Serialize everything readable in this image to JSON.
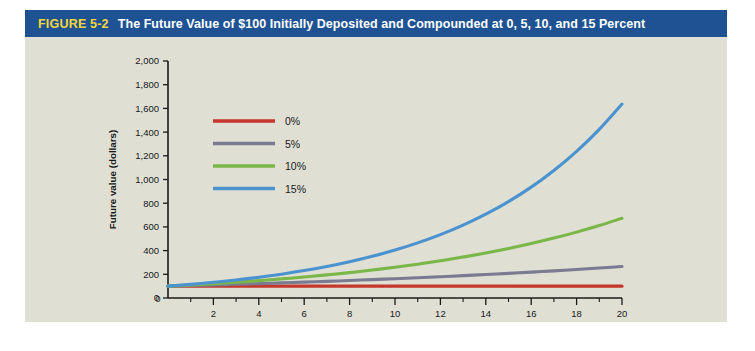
{
  "figure": {
    "number_label": "FIGURE 5-2",
    "title": "The Future Value of $100 Initially Deposited and Compounded at 0, 5, 10, and 15 Percent",
    "header_bg": "#1e5293",
    "number_color": "#f5d73a",
    "title_color": "#ffffff",
    "panel_bg": "#dfdfd4"
  },
  "chart_data": {
    "type": "line",
    "title": "The Future Value of $100 Initially Deposited and Compounded at 0, 5, 10, and 15 Percent",
    "xlabel": "Number of years",
    "ylabel": "Future value (dollars)",
    "xlim": [
      0,
      20
    ],
    "ylim": [
      0,
      2000
    ],
    "grid": false,
    "legend_position": "upper-left-inside",
    "x_ticks_major": [
      0,
      2,
      4,
      6,
      8,
      10,
      12,
      14,
      16,
      18,
      20
    ],
    "x_tick_labels": [
      "0",
      "2",
      "4",
      "6",
      "8",
      "10",
      "12",
      "14",
      "16",
      "18",
      "20"
    ],
    "x_ticks_minor": [
      1,
      3,
      5,
      7,
      9,
      11,
      13,
      15,
      17,
      19
    ],
    "y_ticks": [
      0,
      200,
      400,
      600,
      800,
      1000,
      1200,
      1400,
      1600,
      1800,
      2000
    ],
    "y_tick_labels": [
      "0",
      "200",
      "400",
      "600",
      "800",
      "1,000",
      "1,200",
      "1,400",
      "1,600",
      "1,800",
      "2,000"
    ],
    "x": [
      0,
      1,
      2,
      3,
      4,
      5,
      6,
      7,
      8,
      9,
      10,
      11,
      12,
      13,
      14,
      15,
      16,
      17,
      18,
      19,
      20
    ],
    "series": [
      {
        "name": "0%",
        "color": "#c4372a",
        "values": [
          100,
          100,
          100,
          100,
          100,
          100,
          100,
          100,
          100,
          100,
          100,
          100,
          100,
          100,
          100,
          100,
          100,
          100,
          100,
          100,
          100
        ]
      },
      {
        "name": "5%",
        "color": "#7a7a92",
        "values": [
          100,
          105,
          110.3,
          115.8,
          121.6,
          127.6,
          134,
          140.7,
          147.7,
          155.1,
          162.9,
          171,
          179.6,
          188.6,
          198,
          207.9,
          218.3,
          229.2,
          240.7,
          252.7,
          265.3
        ]
      },
      {
        "name": "10%",
        "color": "#7ab648",
        "values": [
          100,
          110,
          121,
          133.1,
          146.4,
          161.1,
          177.2,
          194.9,
          214.4,
          235.8,
          259.4,
          285.3,
          313.8,
          345.2,
          379.7,
          417.7,
          459.5,
          505.4,
          555.9,
          611.6,
          672.7
        ]
      },
      {
        "name": "15%",
        "color": "#4a93cf",
        "values": [
          100,
          115,
          132.3,
          152.1,
          174.9,
          201.1,
          231.3,
          266,
          305.9,
          351.8,
          404.6,
          465.2,
          535,
          615.3,
          707.6,
          813.7,
          935.8,
          1076.3,
          1237.7,
          1423.3,
          1636.7
        ]
      }
    ]
  },
  "legend": {
    "entries": [
      {
        "label": "0%"
      },
      {
        "label": "5%"
      },
      {
        "label": "10%"
      },
      {
        "label": "15%"
      }
    ]
  }
}
